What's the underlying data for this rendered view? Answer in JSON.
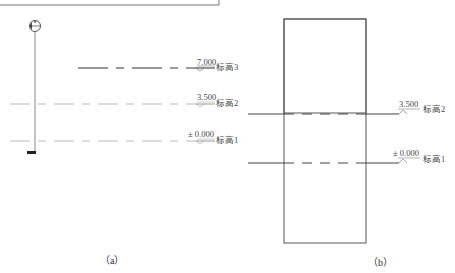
{
  "panel_a": {
    "caption": "（a）",
    "levels": [
      {
        "value": "7.000",
        "name": "标高3"
      },
      {
        "value": "3.500",
        "name": "标高2"
      },
      {
        "value": "± 0.000",
        "name": "标高1"
      }
    ]
  },
  "panel_b": {
    "caption": "（b）",
    "levels": [
      {
        "value": "3.500",
        "name": "标高2"
      },
      {
        "value": "± 0.000",
        "name": "标高1"
      }
    ]
  },
  "colors": {
    "line_dark": "#333333",
    "line_light": "#b8b8b8",
    "text": "#444444"
  }
}
